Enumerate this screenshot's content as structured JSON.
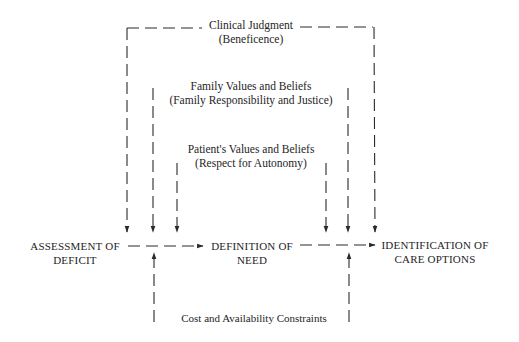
{
  "diagram": {
    "influences": {
      "clinical": {
        "title": "Clinical Judgment",
        "principle": "(Beneficence)"
      },
      "family": {
        "title": "Family Values and Beliefs",
        "principle": "(Family Responsibility and Justice)"
      },
      "patient": {
        "title": "Patient's Values and Beliefs",
        "principle": "(Respect for Autonomy)"
      },
      "constraints": {
        "title": "Cost and Availability Constraints"
      }
    },
    "process_steps": [
      {
        "line1": "ASSESSMENT OF",
        "line2": "DEFICIT"
      },
      {
        "line1": "DEFINITION OF",
        "line2": "NEED"
      },
      {
        "line1": "IDENTIFICATION OF",
        "line2": "CARE OPTIONS"
      }
    ],
    "line_style": "dashed",
    "line_color": "#2a2a2a"
  }
}
